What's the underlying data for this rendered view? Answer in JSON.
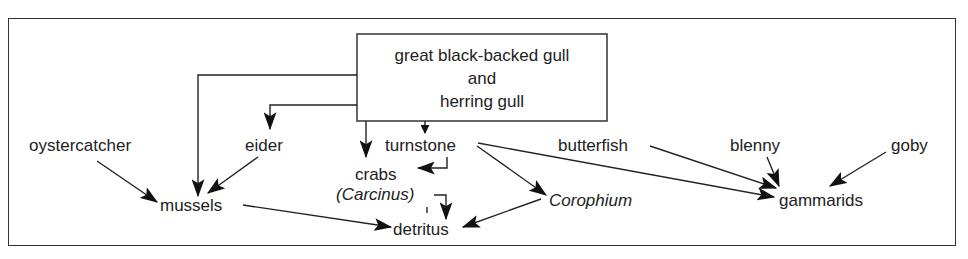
{
  "diagram": {
    "type": "food-web",
    "colors": {
      "line": "#222222",
      "text": "#222222",
      "background": "#ffffff"
    },
    "top_box": {
      "lines": [
        "great black-backed gull",
        "and",
        "herring gull"
      ]
    },
    "nodes": {
      "oystercatcher": "oystercatcher",
      "eider": "eider",
      "turnstone": "turnstone",
      "butterfish": "butterfish",
      "blenny": "blenny",
      "goby": "goby",
      "crabs": "crabs",
      "carcinus": "(Carcinus)",
      "mussels": "mussels",
      "corophium": "Corophium",
      "gammarids": "gammarids",
      "detritus": "detritus"
    },
    "edges": [
      {
        "from": "great black-backed gull and herring gull",
        "to": "mussels"
      },
      {
        "from": "great black-backed gull and herring gull",
        "to": "eider"
      },
      {
        "from": "great black-backed gull and herring gull",
        "to": "crabs"
      },
      {
        "from": "great black-backed gull and herring gull",
        "to": "turnstone"
      },
      {
        "from": "oystercatcher",
        "to": "mussels"
      },
      {
        "from": "eider",
        "to": "mussels"
      },
      {
        "from": "turnstone",
        "to": "crabs"
      },
      {
        "from": "turnstone",
        "to": "Corophium"
      },
      {
        "from": "turnstone",
        "to": "gammarids"
      },
      {
        "from": "butterfish",
        "to": "gammarids"
      },
      {
        "from": "blenny",
        "to": "gammarids"
      },
      {
        "from": "goby",
        "to": "gammarids"
      },
      {
        "from": "mussels",
        "to": "detritus"
      },
      {
        "from": "crabs",
        "to": "detritus"
      },
      {
        "from": "Corophium",
        "to": "detritus"
      }
    ]
  }
}
